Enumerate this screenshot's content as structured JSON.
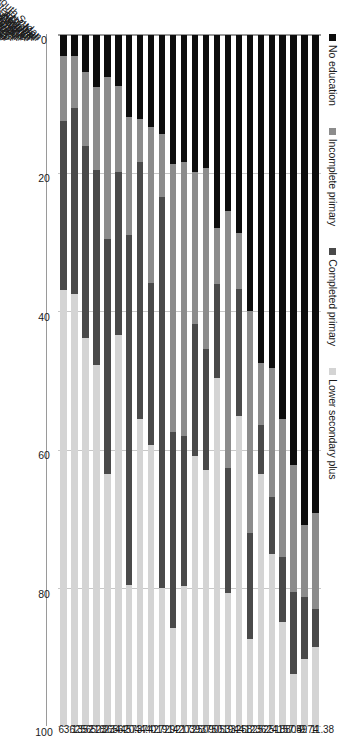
{
  "chart_data": {
    "type": "bar",
    "subtype": "stacked-bar-horizontal",
    "title": "",
    "xlabel": "",
    "ylabel": "",
    "ylim": [
      0,
      100
    ],
    "ticks": [
      "0",
      "20",
      "40",
      "60",
      "80",
      "100"
    ],
    "grid": true,
    "legend_position": "top-left",
    "orientation": "rotated-90",
    "series": [
      {
        "name": "No education",
        "color": "#0d0d0d"
      },
      {
        "name": "Incomplete primary",
        "color": "#8c8c8c"
      },
      {
        "name": "Completed primary",
        "color": "#4a4a4a"
      },
      {
        "name": "Lower secondary plus",
        "color": "#d4d4d4"
      }
    ],
    "categories": [
      "South Sudan",
      "Mali",
      "Chad",
      "Ethiopia",
      "Cote d'Ivoire",
      "Sudan",
      "Burundi",
      "Nigeria",
      "Mozambique",
      "Ghana",
      "Cameroon",
      "Zambia",
      "Malawi",
      "Rwanda",
      "Tanzania",
      "DRC",
      "Congo, Rep",
      "Uganda",
      "Namibia",
      "Lesotho",
      "Kenya",
      "Swaziland",
      "Zimbabwe",
      "South Africa"
    ],
    "rows": [
      {
        "category": "South Sudan",
        "no_education": 69.2,
        "incomplete_primary": 13.8,
        "completed_primary": 5.62,
        "lower_secondary_plus": 11.38,
        "label": "11.38"
      },
      {
        "category": "Mali",
        "no_education": 70.9,
        "incomplete_primary": 10.4,
        "completed_primary": 8.96,
        "lower_secondary_plus": 9.74,
        "label": "9.74"
      },
      {
        "category": "Chad",
        "no_education": 62.3,
        "incomplete_primary": 18.3,
        "completed_primary": 11.91,
        "lower_secondary_plus": 7.49,
        "label": "7.49"
      },
      {
        "category": "Ethiopia",
        "no_education": 55.6,
        "incomplete_primary": 19.9,
        "completed_primary": 9.45,
        "lower_secondary_plus": 15.05,
        "label": "15.05"
      },
      {
        "category": "Cote d'Ivoire",
        "no_education": 48.2,
        "incomplete_primary": 18.7,
        "completed_primary": 8.22,
        "lower_secondary_plus": 24.88,
        "label": "24.88"
      },
      {
        "category": "Sudan",
        "no_education": 47.4,
        "incomplete_primary": 9.1,
        "completed_primary": 6.99,
        "lower_secondary_plus": 36.51,
        "label": "36.51"
      },
      {
        "category": "Burundi",
        "no_education": 40.0,
        "incomplete_primary": 32.1,
        "completed_primary": 15.38,
        "lower_secondary_plus": 12.52,
        "label": "12.52"
      },
      {
        "category": "Nigeria",
        "no_education": 28.6,
        "incomplete_primary": 8.1,
        "completed_primary": 18.48,
        "lower_secondary_plus": 44.82,
        "label": "44.82"
      },
      {
        "category": "Mozambique",
        "no_education": 25.4,
        "incomplete_primary": 37.2,
        "completed_primary": 18.15,
        "lower_secondary_plus": 19.25,
        "label": "19.25"
      },
      {
        "category": "Ghana",
        "no_education": 28.0,
        "incomplete_primary": 8.1,
        "completed_primary": 13.57,
        "lower_secondary_plus": 50.33,
        "label": "50.33"
      },
      {
        "category": "Cameroon",
        "no_education": 19.3,
        "incomplete_primary": 26.1,
        "completed_primary": 17.55,
        "lower_secondary_plus": 37.05,
        "label": "37.05"
      },
      {
        "category": "Zambia",
        "no_education": 19.8,
        "incomplete_primary": 22.0,
        "completed_primary": 19.11,
        "lower_secondary_plus": 39.09,
        "label": "39.09"
      },
      {
        "category": "Malawi",
        "no_education": 18.4,
        "incomplete_primary": 39.7,
        "completed_primary": 21.65,
        "lower_secondary_plus": 20.25,
        "label": "20.25"
      },
      {
        "category": "Rwanda",
        "no_education": 18.6,
        "incomplete_primary": 38.9,
        "completed_primary": 28.33,
        "lower_secondary_plus": 14.17,
        "label": "14.17"
      },
      {
        "category": "Tanzania",
        "no_education": 14.3,
        "incomplete_primary": 9.2,
        "completed_primary": 56.58,
        "lower_secondary_plus": 19.92,
        "label": "19.92"
      },
      {
        "category": "DRC",
        "no_education": 13.3,
        "incomplete_primary": 22.6,
        "completed_primary": 23.38,
        "lower_secondary_plus": 40.72,
        "label": "40.72"
      },
      {
        "category": "Congo, Rep",
        "no_education": 12.1,
        "incomplete_primary": 6.3,
        "completed_primary": 37.17,
        "lower_secondary_plus": 44.42,
        "label": "44.42"
      },
      {
        "category": "Uganda",
        "no_education": 11.9,
        "incomplete_primary": 17.0,
        "completed_primary": 50.73,
        "lower_secondary_plus": 20.37,
        "label": "20.37"
      },
      {
        "category": "Namibia",
        "no_education": 7.4,
        "incomplete_primary": 12.4,
        "completed_primary": 23.63,
        "lower_secondary_plus": 56.57,
        "label": "56.57"
      },
      {
        "category": "Lesotho",
        "no_education": 6.1,
        "incomplete_primary": 23.4,
        "completed_primary": 34.05,
        "lower_secondary_plus": 36.44,
        "label": "36.44"
      },
      {
        "category": "Kenya",
        "no_education": 7.5,
        "incomplete_primary": 12.0,
        "completed_primary": 28.27,
        "lower_secondary_plus": 52.23,
        "label": "52.23"
      },
      {
        "category": "Swaziland",
        "no_education": 5.4,
        "incomplete_primary": 10.6,
        "completed_primary": 27.82,
        "lower_secondary_plus": 56.18,
        "label": "56.18"
      },
      {
        "category": "Zimbabwe",
        "no_education": 3.1,
        "incomplete_primary": 7.4,
        "completed_primary": 26.98,
        "lower_secondary_plus": 62.52,
        "label": "62.52"
      },
      {
        "category": "South Africa",
        "no_education": 3.0,
        "incomplete_primary": 9.4,
        "completed_primary": 24.47,
        "lower_secondary_plus": 63.13,
        "label": "63.13"
      }
    ]
  }
}
